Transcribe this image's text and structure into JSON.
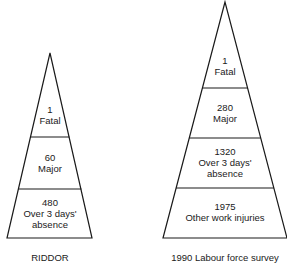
{
  "pyramids": [
    {
      "caption": "RIDDOR",
      "tiers": [
        {
          "value": "1",
          "label": "Fatal"
        },
        {
          "value": "60",
          "label": "Major"
        },
        {
          "value": "480",
          "label": "Over 3 days'",
          "label2": "absence"
        }
      ]
    },
    {
      "caption": "1990 Labour force survey",
      "tiers": [
        {
          "value": "1",
          "label": "Fatal"
        },
        {
          "value": "280",
          "label": "Major"
        },
        {
          "value": "1320",
          "label": "Over 3 days'",
          "label2": "absence"
        },
        {
          "value": "1975",
          "label": "Other work injuries"
        }
      ]
    }
  ]
}
